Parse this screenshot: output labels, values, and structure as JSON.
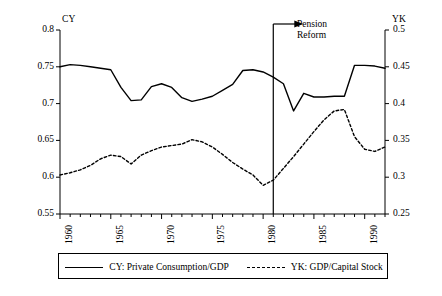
{
  "chart_data": {
    "type": "line",
    "title": "",
    "xlabel": "",
    "ylabel": "CY",
    "y2label": "YK",
    "xlim": [
      1960,
      1992
    ],
    "ylim": [
      0.55,
      0.8
    ],
    "y2lim": [
      0.25,
      0.5
    ],
    "grid": false,
    "legend_position": "bottom",
    "x_tick_labels": [
      "1960",
      "1965",
      "1970",
      "1975",
      "1980",
      "1985",
      "1990"
    ],
    "x_tick_values": [
      1960,
      1965,
      1970,
      1975,
      1980,
      1985,
      1990
    ],
    "y_tick_labels": [
      "0.55",
      "0.6",
      "0.65",
      "0.7",
      "0.75",
      "0.8"
    ],
    "y_tick_values": [
      0.55,
      0.6,
      0.65,
      0.7,
      0.75,
      0.8
    ],
    "y2_tick_labels": [
      "0.25",
      "0.3",
      "0.35",
      "0.4",
      "0.45",
      "0.5"
    ],
    "y2_tick_values": [
      0.25,
      0.3,
      0.35,
      0.4,
      0.45,
      0.5
    ],
    "x": [
      1960,
      1961,
      1962,
      1963,
      1964,
      1965,
      1966,
      1967,
      1968,
      1969,
      1970,
      1971,
      1972,
      1973,
      1974,
      1975,
      1976,
      1977,
      1978,
      1979,
      1980,
      1981,
      1982,
      1983,
      1984,
      1985,
      1986,
      1987,
      1988,
      1989,
      1990,
      1991,
      1992
    ],
    "series": [
      {
        "name": "CY: Private Consumption/GDP",
        "axis": "left",
        "style": "solid",
        "color": "#000000",
        "values": [
          0.75,
          0.753,
          0.752,
          0.75,
          0.748,
          0.746,
          0.722,
          0.704,
          0.705,
          0.723,
          0.727,
          0.722,
          0.708,
          0.703,
          0.706,
          0.71,
          0.718,
          0.726,
          0.745,
          0.746,
          0.743,
          0.736,
          0.727,
          0.69,
          0.714,
          0.709,
          0.709,
          0.71,
          0.71,
          0.752,
          0.752,
          0.751,
          0.748
        ]
      },
      {
        "name": "YK: GDP/Capital Stock",
        "axis": "right",
        "style": "dashed",
        "color": "#000000",
        "values": [
          0.303,
          0.306,
          0.31,
          0.316,
          0.325,
          0.33,
          0.328,
          0.318,
          0.33,
          0.336,
          0.341,
          0.343,
          0.345,
          0.351,
          0.348,
          0.341,
          0.331,
          0.32,
          0.311,
          0.303,
          0.289,
          0.296,
          0.312,
          0.328,
          0.345,
          0.362,
          0.378,
          0.39,
          0.392,
          0.355,
          0.338,
          0.335,
          0.341
        ]
      }
    ],
    "annotations": [
      {
        "name": "pension-reform",
        "label": "Pension\nReform",
        "x": 1981,
        "type": "vline-with-arrow"
      }
    ]
  },
  "legend": {
    "entries": [
      {
        "label": "CY: Private Consumption/GDP",
        "style": "solid"
      },
      {
        "label": "YK: GDP/Capital Stock",
        "style": "dashed"
      }
    ]
  }
}
